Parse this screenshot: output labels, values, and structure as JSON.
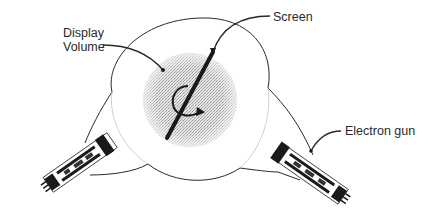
{
  "diagram": {
    "labels": {
      "display_volume_line1": "Display",
      "display_volume_line2": "Volume",
      "screen": "Screen",
      "electron_gun": "Electron gun"
    },
    "components": [
      {
        "name": "bulb",
        "shape": "circle with two funnel necks"
      },
      {
        "name": "display-volume",
        "shape": "stippled disc"
      },
      {
        "name": "screen",
        "shape": "thick diagonal bar through center"
      },
      {
        "name": "rotation-arrow",
        "shape": "circular arrow around screen axis"
      },
      {
        "name": "electron-gun-left",
        "shape": "gun assembly, lower-left neck"
      },
      {
        "name": "electron-gun-right",
        "shape": "gun assembly, lower-right neck"
      }
    ],
    "colors": {
      "line": "#2a2a2a",
      "stipple": "#cfcfcf",
      "background": "#ffffff"
    }
  }
}
